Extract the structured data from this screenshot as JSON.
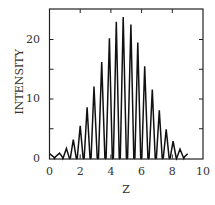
{
  "chart_data": {
    "type": "line",
    "title": "",
    "xlabel": "Z",
    "ylabel": "INTENSITY",
    "xlim": [
      0,
      10
    ],
    "ylim": [
      0,
      25
    ],
    "grid": false,
    "legend": null,
    "x_ticks": [
      0,
      2,
      4,
      6,
      8,
      10
    ],
    "x_tick_labels": [
      "0",
      "2",
      "4",
      "6",
      "8",
      "10"
    ],
    "y_ticks": [
      0,
      10,
      20
    ],
    "y_tick_labels": [
      "0",
      "10",
      "20"
    ],
    "y_minor_ticks": [
      5,
      15
    ],
    "peaks": {
      "z": [
        0.0,
        0.65,
        1.1,
        1.55,
        2.0,
        2.45,
        2.9,
        3.4,
        3.9,
        4.35,
        4.8,
        5.3,
        5.75,
        6.2,
        6.7,
        7.15,
        7.6,
        8.05,
        8.5,
        9.0
      ],
      "intensity": [
        0.8,
        0.9,
        1.7,
        3.2,
        5.5,
        8.6,
        12.1,
        16.2,
        20.2,
        23.0,
        23.8,
        22.5,
        19.5,
        15.5,
        11.6,
        8.1,
        4.9,
        2.9,
        1.6,
        0.8
      ]
    },
    "minima_intensity": 0
  },
  "axes": {
    "xlabel": "Z",
    "ylabel": "INTENSITY",
    "x_tick_labels": [
      "0",
      "2",
      "4",
      "6",
      "8",
      "10"
    ],
    "y_tick_labels": [
      "0",
      "10",
      "20"
    ]
  }
}
